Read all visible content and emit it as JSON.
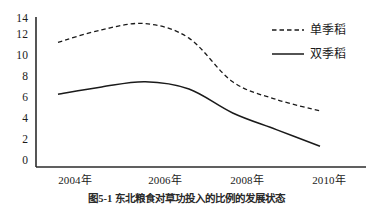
{
  "chart_data": {
    "type": "line",
    "title": "",
    "caption": "图5-1 东北粮食对草功投入的比例的发展状态",
    "xlabel": "",
    "ylabel": "",
    "x": [
      2004,
      2005,
      2006,
      2007,
      2008,
      2009,
      2010
    ],
    "xtick_labels": [
      "2004年",
      "2006年",
      "2008年",
      "2010年"
    ],
    "xtick_values": [
      2004,
      2006,
      2008,
      2010
    ],
    "ytick_labels": [
      "0",
      "2",
      "4",
      "6",
      "8",
      "10",
      "12",
      "14"
    ],
    "ytick_values": [
      0,
      2,
      4,
      6,
      8,
      10,
      12,
      14
    ],
    "ylim": [
      0,
      14.8
    ],
    "xlim": [
      2004,
      2010.6
    ],
    "grid": false,
    "legend_position": "top-right",
    "series": [
      {
        "name": "单季稻",
        "style": "dashed",
        "color": "#1a1a1a",
        "values": [
          12.0,
          13.2,
          13.8,
          12.4,
          8.2,
          6.5,
          5.4
        ]
      },
      {
        "name": "双季稻",
        "style": "solid",
        "color": "#1a1a1a",
        "values": [
          7.0,
          7.7,
          8.2,
          7.5,
          5.2,
          3.6,
          2.0
        ]
      }
    ]
  },
  "axes": {
    "y_axis_name": "y-axis",
    "x_axis_name": "x-axis"
  }
}
